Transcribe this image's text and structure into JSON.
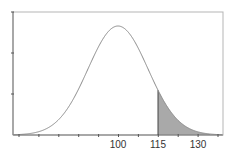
{
  "chart_data": {
    "type": "area",
    "title": "",
    "xlabel": "",
    "ylabel": "",
    "distribution": "normal",
    "mean": 100,
    "x_tick_labels": [
      "100",
      "115",
      "130"
    ],
    "x_tick_label_values": [
      100,
      115,
      130
    ],
    "minor_tick_count": 11,
    "y_ticks_unlabeled": 3,
    "shaded_region": {
      "from": 115,
      "to": 130,
      "color": "#a9a9a9"
    },
    "curve_color": "#8a8a8a",
    "axis_color": "#777777",
    "frame_color": "#b5b5b5",
    "grid": false,
    "legend": false
  }
}
